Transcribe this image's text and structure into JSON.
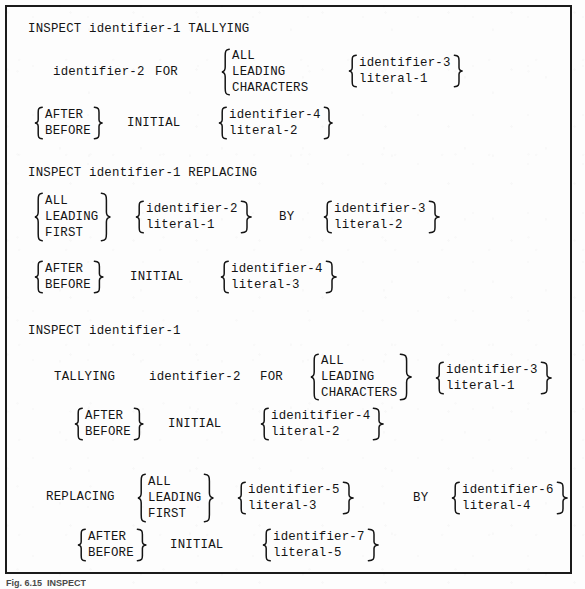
{
  "figure": {
    "caption": "Fig. 6.15  INSPECT",
    "box_border_color": "#1b1b1b",
    "text_color": "#141414",
    "page_background": "#fdfdfd"
  },
  "formats": [
    {
      "id": "format-1",
      "header": "INSPECT identifier-1 TALLYING",
      "lines": [
        {
          "id": "f1-line-1",
          "tokens": [
            "identifier-2",
            "FOR"
          ],
          "groups": [
            {
              "id": "f1-for-group",
              "left_brace": true,
              "right_brace": false,
              "options": [
                "ALL",
                "LEADING",
                "CHARACTERS"
              ]
            },
            {
              "id": "f1-arg-group",
              "left_brace": true,
              "right_brace": true,
              "options": [
                "identifier-3",
                "literal-1"
              ]
            }
          ]
        },
        {
          "id": "f1-line-2",
          "tokens": [
            "INITIAL"
          ],
          "groups": [
            {
              "id": "f1-afterbefore-group",
              "left_brace": true,
              "right_brace": true,
              "options": [
                "AFTER",
                "BEFORE"
              ]
            },
            {
              "id": "f1-initial-arg-group",
              "left_brace": true,
              "right_brace": true,
              "options": [
                "identifier-4",
                "literal-2"
              ]
            }
          ]
        }
      ]
    },
    {
      "id": "format-2",
      "header": "INSPECT identifier-1 REPLACING",
      "lines": [
        {
          "id": "f2-line-1",
          "tokens": [
            "BY"
          ],
          "groups": [
            {
              "id": "f2-mode-group",
              "left_brace": true,
              "right_brace": true,
              "options": [
                "ALL",
                "LEADING",
                "FIRST"
              ]
            },
            {
              "id": "f2-src-group",
              "left_brace": true,
              "right_brace": true,
              "options": [
                "identifier-2",
                "literal-1"
              ]
            },
            {
              "id": "f2-dst-group",
              "left_brace": true,
              "right_brace": true,
              "options": [
                "identifier-3",
                "literal-2"
              ]
            }
          ]
        },
        {
          "id": "f2-line-2",
          "tokens": [
            "INITIAL"
          ],
          "groups": [
            {
              "id": "f2-afterbefore-group",
              "left_brace": true,
              "right_brace": true,
              "options": [
                "AFTER",
                "BEFORE"
              ]
            },
            {
              "id": "f2-initial-arg-group",
              "left_brace": true,
              "right_brace": true,
              "options": [
                "identifier-4",
                "literal-3"
              ]
            }
          ]
        }
      ]
    },
    {
      "id": "format-3",
      "header": "INSPECT identifier-1",
      "lines": [
        {
          "id": "f3-line-1",
          "tokens": [
            "TALLYING",
            "identifier-2",
            "FOR"
          ],
          "groups": [
            {
              "id": "f3-for-group",
              "left_brace": true,
              "right_brace": true,
              "options": [
                "ALL",
                "LEADING",
                "CHARACTERS"
              ]
            },
            {
              "id": "f3-for-arg-group",
              "left_brace": true,
              "right_brace": true,
              "options": [
                "identifier-3",
                "literal-1"
              ]
            }
          ]
        },
        {
          "id": "f3-line-2",
          "tokens": [
            "INITIAL"
          ],
          "groups": [
            {
              "id": "f3-afterbefore-group-1",
              "left_brace": true,
              "right_brace": true,
              "options": [
                "AFTER",
                "BEFORE"
              ]
            },
            {
              "id": "f3-initial-arg-group-1",
              "left_brace": true,
              "right_brace": true,
              "options": [
                "idenitifier-4",
                "literal-2"
              ]
            }
          ]
        },
        {
          "id": "f3-line-3",
          "tokens": [
            "REPLACING",
            "BY"
          ],
          "groups": [
            {
              "id": "f3-mode-group",
              "left_brace": true,
              "right_brace": true,
              "options": [
                "ALL",
                "LEADING",
                "FIRST"
              ]
            },
            {
              "id": "f3-src-group",
              "left_brace": true,
              "right_brace": true,
              "options": [
                "identifier-5",
                "literal-3"
              ]
            },
            {
              "id": "f3-dst-group",
              "left_brace": true,
              "right_brace": true,
              "options": [
                "identifier-6",
                "literal-4"
              ]
            }
          ]
        },
        {
          "id": "f3-line-4",
          "tokens": [
            "INITIAL"
          ],
          "groups": [
            {
              "id": "f3-afterbefore-group-2",
              "left_brace": true,
              "right_brace": true,
              "options": [
                "AFTER",
                "BEFORE"
              ]
            },
            {
              "id": "f3-initial-arg-group-2",
              "left_brace": true,
              "right_brace": true,
              "options": [
                "identifier-7",
                "literal-5"
              ]
            }
          ]
        }
      ]
    }
  ],
  "text": {
    "f1_header": "INSPECT identifier-1 TALLYING",
    "f1_identifier2": "identifier-2",
    "f1_for": "FOR",
    "f1_all": "ALL",
    "f1_leading": "LEADING",
    "f1_characters": "CHARACTERS",
    "f1_identifier3": "identifier-3",
    "f1_literal1": "literal-1",
    "f1_after": "AFTER",
    "f1_before": "BEFORE",
    "f1_initial": "INITIAL",
    "f1_identifier4": "identifier-4",
    "f1_literal2": "literal-2",
    "f2_header": "INSPECT identifier-1 REPLACING",
    "f2_all": "ALL",
    "f2_leading": "LEADING",
    "f2_first": "FIRST",
    "f2_identifier2": "identifier-2",
    "f2_literal1": "literal-1",
    "f2_by": "BY",
    "f2_identifier3": "identifier-3",
    "f2_literal2": "literal-2",
    "f2_after": "AFTER",
    "f2_before": "BEFORE",
    "f2_initial": "INITIAL",
    "f2_identifier4": "identifier-4",
    "f2_literal3": "literal-3",
    "f3_header": "INSPECT identifier-1",
    "f3_tallying": "TALLYING",
    "f3_identifier2": "identifier-2",
    "f3_for": "FOR",
    "f3_all": "ALL",
    "f3_leading": "LEADING",
    "f3_characters": "CHARACTERS",
    "f3_identifier3": "identifier-3",
    "f3_literal1": "literal-1",
    "f3_after1": "AFTER",
    "f3_before1": "BEFORE",
    "f3_initial1": "INITIAL",
    "f3_idenitifier4": "idenitifier-4",
    "f3_literal2": "literal-2",
    "f3_replacing": "REPLACING",
    "f3_all2": "ALL",
    "f3_leading2": "LEADING",
    "f3_first2": "FIRST",
    "f3_identifier5": "identifier-5",
    "f3_literal3": "literal-3",
    "f3_by": "BY",
    "f3_identifier6": "identifier-6",
    "f3_literal4": "literal-4",
    "f3_after2": "AFTER",
    "f3_before2": "BEFORE",
    "f3_initial2": "INITIAL",
    "f3_identifier7": "identifier-7",
    "f3_literal5": "literal-5",
    "caption": "Fig. 6.15  INSPECT"
  }
}
